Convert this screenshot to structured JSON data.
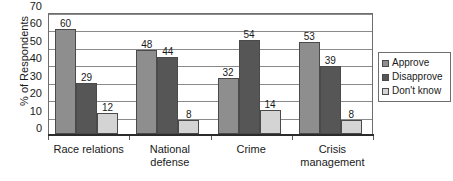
{
  "chart_data": {
    "type": "bar",
    "title": "",
    "xlabel": "",
    "ylabel": "% of Respondents",
    "ylim": [
      0,
      70
    ],
    "yticks": [
      0,
      10,
      20,
      30,
      40,
      50,
      60,
      70
    ],
    "grid": true,
    "legend_position": "right",
    "categories": [
      "Race relations",
      "National defense",
      "Crime",
      "Crisis management"
    ],
    "series": [
      {
        "name": "Approve",
        "color": "#8e8e8e",
        "values": [
          60,
          48,
          32,
          53
        ]
      },
      {
        "name": "Disapprove",
        "color": "#565656",
        "values": [
          29,
          44,
          54,
          39
        ]
      },
      {
        "name": "Don't know",
        "color": "#d4d4d4",
        "values": [
          12,
          8,
          14,
          8
        ]
      }
    ]
  },
  "axes": {
    "y_title": "% of Respondents",
    "y_ticks": [
      "0",
      "10",
      "20",
      "30",
      "40",
      "50",
      "60",
      "70"
    ],
    "x_categories": [
      {
        "line1": "Race relations",
        "line2": ""
      },
      {
        "line1": "National",
        "line2": "defense"
      },
      {
        "line1": "Crime",
        "line2": ""
      },
      {
        "line1": "Crisis",
        "line2": "management"
      }
    ]
  },
  "legend": {
    "items": [
      {
        "label": "Approve",
        "swatch": "#8e8e8e"
      },
      {
        "label": "Disapprove",
        "swatch": "#565656"
      },
      {
        "label": "Don't know",
        "swatch": "#d4d4d4"
      }
    ]
  },
  "data_labels": {
    "group0": [
      "60",
      "29",
      "12"
    ],
    "group1": [
      "48",
      "44",
      "8"
    ],
    "group2": [
      "32",
      "54",
      "14"
    ],
    "group3": [
      "53",
      "39",
      "8"
    ]
  }
}
